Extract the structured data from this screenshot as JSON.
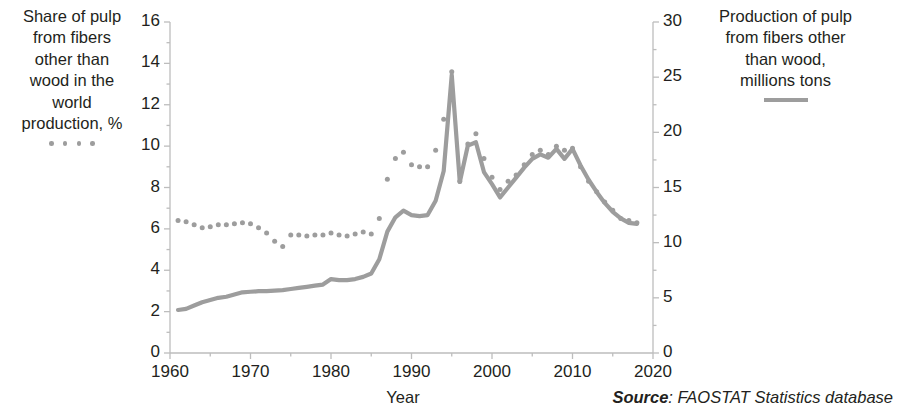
{
  "legend_left": {
    "text": "Share of pulp from fibers other than wood in the world production, %",
    "lines": [
      "Share of pulp",
      "from fibers",
      "other than",
      "wood in the",
      "world",
      "production, %"
    ],
    "marker": "dotted-marker-swatch"
  },
  "legend_right": {
    "text": "Production of pulp from fibers other than wood, millions tons",
    "lines": [
      "Production of pulp",
      "from fibers other",
      "than wood,",
      "millions tons"
    ],
    "marker": "solid-line-swatch"
  },
  "axis": {
    "x_title": "Year",
    "left_ticks": [
      "0",
      "2",
      "4",
      "6",
      "8",
      "10",
      "12",
      "14",
      "16"
    ],
    "right_ticks": [
      "0",
      "5",
      "10",
      "15",
      "20",
      "25",
      "30"
    ],
    "x_ticks": [
      "1960",
      "1970",
      "1980",
      "1990",
      "2000",
      "2010",
      "2020"
    ]
  },
  "source": {
    "prefix": "Source",
    "rest": ": FAOSTAT Statistics database"
  },
  "colors": {
    "series": "#9d9d9d",
    "axis": "#bdbdbd",
    "text": "#231f20"
  },
  "chart_data": {
    "type": "line",
    "title": "",
    "xlabel": "Year",
    "ylabel": "Share of pulp from fibers other than wood in the world production, %",
    "y2label": "Production of pulp from fibers other than wood, millions tons",
    "xlim": [
      1960,
      2020
    ],
    "ylim": [
      0,
      16
    ],
    "y2lim": [
      0,
      30
    ],
    "grid": false,
    "legend_position": "outside-left-and-right",
    "x": [
      1961,
      1962,
      1963,
      1964,
      1965,
      1966,
      1967,
      1968,
      1969,
      1970,
      1971,
      1972,
      1973,
      1974,
      1975,
      1976,
      1977,
      1978,
      1979,
      1980,
      1981,
      1982,
      1983,
      1984,
      1985,
      1986,
      1987,
      1988,
      1989,
      1990,
      1991,
      1992,
      1993,
      1994,
      1995,
      1996,
      1997,
      1998,
      1999,
      2000,
      2001,
      2002,
      2003,
      2004,
      2005,
      2006,
      2007,
      2008,
      2009,
      2010,
      2011,
      2012,
      2013,
      2014,
      2015,
      2016,
      2017,
      2018
    ],
    "series": [
      {
        "name": "Share of pulp from fibers other than wood in the world production, %",
        "axis": "left",
        "style": "dotted",
        "unit": "%",
        "values": [
          6.4,
          6.35,
          6.2,
          6.05,
          6.1,
          6.2,
          6.2,
          6.25,
          6.3,
          6.25,
          6.05,
          5.8,
          5.4,
          5.15,
          5.7,
          5.7,
          5.65,
          5.7,
          5.7,
          5.8,
          5.7,
          5.65,
          5.75,
          5.85,
          5.75,
          6.5,
          8.4,
          9.4,
          9.7,
          9.1,
          9.0,
          9.0,
          9.8,
          11.3,
          13.6,
          8.3,
          10.1,
          10.6,
          9.4,
          8.5,
          7.9,
          8.3,
          8.6,
          9.1,
          9.6,
          9.8,
          9.6,
          10.0,
          9.8,
          9.9,
          9.0,
          8.3,
          7.8,
          7.3,
          6.9,
          6.5,
          6.4,
          6.3
        ]
      },
      {
        "name": "Production of pulp from fibers other than wood, millions tons",
        "axis": "right",
        "style": "solid",
        "unit": "millions tons",
        "values": [
          3.9,
          4.0,
          4.3,
          4.6,
          4.8,
          5.0,
          5.1,
          5.3,
          5.5,
          5.55,
          5.6,
          5.6,
          5.65,
          5.7,
          5.8,
          5.9,
          6.0,
          6.1,
          6.2,
          6.7,
          6.6,
          6.6,
          6.7,
          6.9,
          7.2,
          8.5,
          11.0,
          12.3,
          12.9,
          12.5,
          12.4,
          12.5,
          13.8,
          16.5,
          25.2,
          15.5,
          18.8,
          19.1,
          16.4,
          15.3,
          14.1,
          15.0,
          15.9,
          16.8,
          17.6,
          18.0,
          17.7,
          18.5,
          17.6,
          18.5,
          17.0,
          15.7,
          14.6,
          13.6,
          12.8,
          12.2,
          11.8,
          11.7
        ]
      }
    ]
  }
}
